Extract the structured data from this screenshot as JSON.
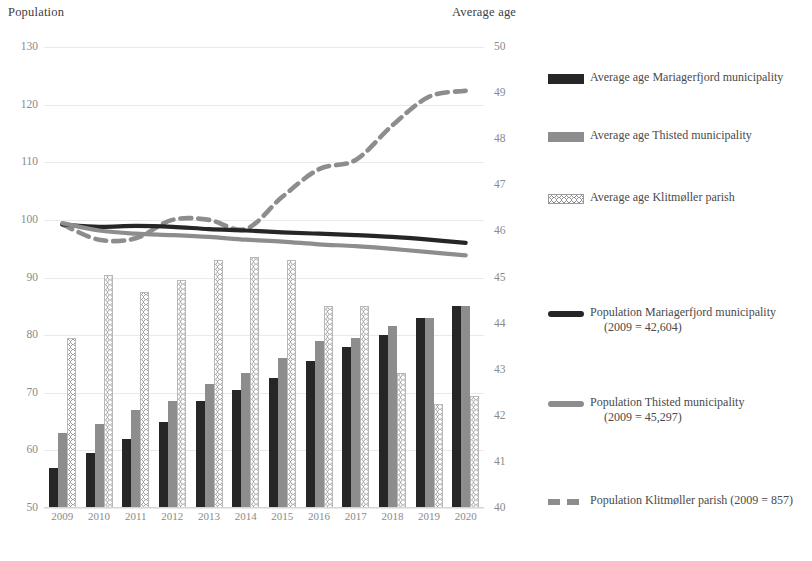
{
  "left_axis_title": "Population",
  "right_axis_title": "Average age",
  "left_ticks": [
    "130",
    "120",
    "110",
    "100",
    "90",
    "80",
    "70",
    "60",
    "50"
  ],
  "right_ticks": [
    "50",
    "49",
    "48",
    "47",
    "46",
    "45",
    "44",
    "43",
    "42",
    "41",
    "40"
  ],
  "x_ticks": [
    "2009",
    "2010",
    "2011",
    "2012",
    "2013",
    "2014",
    "2015",
    "2016",
    "2017",
    "2018",
    "2019",
    "2020"
  ],
  "legend": [
    {
      "key": "bar-black",
      "label": "Average age Mariagerfjord municipality",
      "line2": ""
    },
    {
      "key": "bar-gray",
      "label": "Average age Thisted municipality",
      "line2": ""
    },
    {
      "key": "bar-dot",
      "label": "Average age Klitmøller parish",
      "line2": ""
    },
    {
      "key": "line-black",
      "label": "Population Mariagerfjord municipality",
      "line2": "(2009 = 42,604)"
    },
    {
      "key": "line-gray",
      "label": "Population Thisted municipality",
      "line2": "(2009 = 45,297)"
    },
    {
      "key": "line-dash",
      "label": "Population Klitmøller parish (2009 = 857)",
      "line2": ""
    }
  ],
  "colors": {
    "black": "#262626",
    "gray": "#8d8d8d",
    "dotted_fill": "#ffffff",
    "dotted_stroke": "#9a9a9a",
    "grid": "#e9e9e9",
    "tick_text": "#8a8a8a",
    "title_text": "#404040"
  },
  "chart_data": {
    "type": "bar",
    "title": "",
    "subtitle": "",
    "xlabel": "",
    "ylabel": "Population",
    "y2label": "Average age",
    "categories": [
      "2009",
      "2010",
      "2011",
      "2012",
      "2013",
      "2014",
      "2015",
      "2016",
      "2017",
      "2018",
      "2019",
      "2020"
    ],
    "ylim": [
      50,
      130
    ],
    "y2lim": [
      40,
      50
    ],
    "ytick_step": 10,
    "y2tick_step": 1,
    "grid": true,
    "legend_position": "right",
    "series": [
      {
        "name": "Average age Mariagerfjord municipality",
        "type": "bar",
        "axis": "left",
        "style": "solid-black",
        "values": [
          57.0,
          59.5,
          62.0,
          65.0,
          68.5,
          70.5,
          72.5,
          75.5,
          78.0,
          80.0,
          83.0,
          85.0
        ]
      },
      {
        "name": "Average age Thisted municipality",
        "type": "bar",
        "axis": "left",
        "style": "solid-gray",
        "values": [
          63.0,
          64.5,
          67.0,
          68.5,
          71.5,
          73.5,
          76.0,
          79.0,
          79.5,
          81.5,
          83.0,
          85.0
        ]
      },
      {
        "name": "Average age Klitmøller parish",
        "type": "bar",
        "axis": "left",
        "style": "dotted-pattern",
        "values": [
          79.5,
          90.5,
          87.5,
          89.5,
          93.0,
          93.5,
          93.0,
          85.0,
          85.0,
          73.5,
          68.0,
          69.5
        ]
      },
      {
        "name": "Population Mariagerfjord municipality (2009 = 42,604)",
        "type": "line",
        "axis": "right",
        "style": "solid-black",
        "values": [
          46.15,
          46.1,
          46.12,
          46.1,
          46.05,
          46.02,
          45.98,
          45.95,
          45.92,
          45.88,
          45.82,
          45.75
        ]
      },
      {
        "name": "Population Thisted municipality (2009 = 45,297)",
        "type": "line",
        "axis": "right",
        "style": "solid-gray",
        "values": [
          46.18,
          46.02,
          45.95,
          45.92,
          45.88,
          45.82,
          45.78,
          45.72,
          45.68,
          45.62,
          45.55,
          45.48
        ]
      },
      {
        "name": "Population Klitmøller parish (2009 = 857)",
        "type": "line",
        "axis": "right",
        "style": "dashed-gray",
        "values": [
          46.15,
          45.82,
          45.85,
          46.25,
          46.25,
          46.05,
          46.75,
          47.35,
          47.55,
          48.3,
          48.92,
          49.05
        ]
      }
    ]
  }
}
